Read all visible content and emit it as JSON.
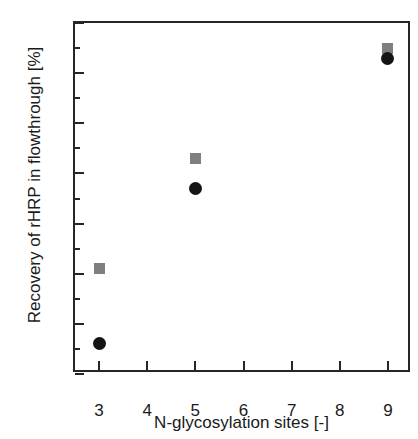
{
  "chart_data": {
    "type": "scatter",
    "title": "",
    "xlabel": "N-glycosylation sites [-]",
    "ylabel": "Recovery of rHRP in flowthrough [%]",
    "xlim": [
      2.5,
      9.5
    ],
    "ylim": [
      30,
      100
    ],
    "xticks": [
      3,
      4,
      5,
      6,
      7,
      8,
      9
    ],
    "xtick_labels": [
      "3",
      "4",
      "5",
      "6",
      "7",
      "8",
      "9"
    ],
    "yticks": [
      30,
      40,
      50,
      60,
      70,
      80,
      90,
      100
    ],
    "ytick_labels": [
      "30",
      "40",
      "50",
      "60",
      "70",
      "80",
      "90",
      "100"
    ],
    "y_minor_ticks": [
      35,
      45,
      55,
      65,
      75,
      85,
      95
    ],
    "x_minor_ticks": [],
    "grid": false,
    "legend": null,
    "series": [
      {
        "name": "gray-square-series",
        "marker": "square",
        "color": "#7f7f7f",
        "x": [
          3,
          5,
          9
        ],
        "values": [
          51,
          73,
          95
        ]
      },
      {
        "name": "black-circle-series",
        "marker": "circle",
        "color": "#141414",
        "x": [
          3,
          5,
          9
        ],
        "values": [
          36,
          67,
          93
        ]
      }
    ]
  }
}
